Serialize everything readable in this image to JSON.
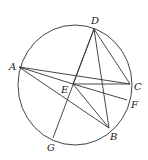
{
  "diagram": {
    "type": "circle-geometry",
    "circle": {
      "cx": 75,
      "cy": 85,
      "rx": 57,
      "ry": 60
    },
    "points": {
      "A": {
        "x": 19,
        "y": 67,
        "label": "A",
        "lx": 9,
        "ly": 70
      },
      "D": {
        "x": 94,
        "y": 29,
        "label": "D",
        "lx": 91,
        "ly": 24
      },
      "C": {
        "x": 130,
        "y": 84,
        "label": "C",
        "lx": 134,
        "ly": 90
      },
      "F": {
        "x": 127,
        "y": 100,
        "label": "F",
        "lx": 131,
        "ly": 108
      },
      "B": {
        "x": 109,
        "y": 128,
        "label": "B",
        "lx": 110,
        "ly": 140
      },
      "G": {
        "x": 53,
        "y": 138,
        "label": "G",
        "lx": 47,
        "ly": 151
      },
      "E": {
        "x": 73,
        "y": 84,
        "label": "E",
        "lx": 61,
        "ly": 93
      }
    },
    "segments": [
      [
        "A",
        "C"
      ],
      [
        "A",
        "E"
      ],
      [
        "A",
        "B"
      ],
      [
        "D",
        "G"
      ],
      [
        "D",
        "B"
      ],
      [
        "D",
        "C"
      ],
      [
        "D",
        "E"
      ],
      [
        "E",
        "C"
      ],
      [
        "E",
        "F"
      ],
      [
        "E",
        "B"
      ]
    ]
  }
}
